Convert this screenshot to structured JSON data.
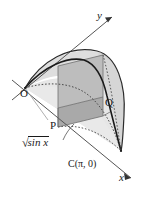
{
  "figure": {
    "kind": "math-3d-solid-diagram",
    "background_color": "#ffffff",
    "ink_color": "#1a1a1a",
    "fill_light": "#e3e3e3",
    "fill_mid": "#cfcfcf",
    "fill_dark": "#b5b5b5"
  },
  "axes": [
    {
      "id": "y-axis",
      "label": "y",
      "arrow": true
    },
    {
      "id": "x-axis",
      "label": "x",
      "arrow": true
    }
  ],
  "points": [
    {
      "id": "origin",
      "label": "O"
    },
    {
      "id": "point-p",
      "label": "P"
    },
    {
      "id": "point-q",
      "label": "Q"
    },
    {
      "id": "point-c",
      "label": "C(π, 0)"
    }
  ],
  "annotations": [
    {
      "id": "curve-function",
      "sqrt_sign": "√",
      "radicand": "sin x"
    }
  ]
}
